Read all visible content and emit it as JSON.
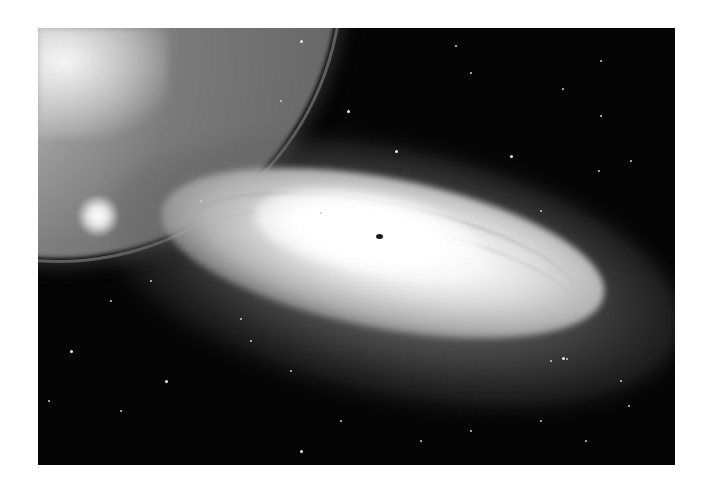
{
  "image": {
    "description": "Grayscale astronomical photograph of a spiral galaxy seen at an oblique angle, with a bright planetary limb in the upper-left corner and a scattered star field on a black background",
    "elements": [
      "planet-limb",
      "galaxy-disk",
      "galaxy-core",
      "bright-knot",
      "star-field"
    ],
    "colors": {
      "page_background": "#ffffff",
      "sky": "#050505",
      "core": "#ffffff",
      "disk": "#b3b3b3"
    }
  },
  "stars": [
    [
      347,
      110
    ],
    [
      320,
      212
    ],
    [
      280,
      100
    ],
    [
      455,
      45
    ],
    [
      470,
      72
    ],
    [
      395,
      150
    ],
    [
      600,
      60
    ],
    [
      562,
      88
    ],
    [
      630,
      160
    ],
    [
      600,
      115
    ],
    [
      510,
      155
    ],
    [
      540,
      210
    ],
    [
      598,
      170
    ],
    [
      620,
      380
    ],
    [
      550,
      360
    ],
    [
      562,
      357
    ],
    [
      566,
      358
    ],
    [
      585,
      440
    ],
    [
      48,
      400
    ],
    [
      120,
      410
    ],
    [
      165,
      380
    ],
    [
      200,
      200
    ],
    [
      240,
      318
    ],
    [
      290,
      370
    ],
    [
      340,
      420
    ],
    [
      300,
      450
    ],
    [
      420,
      440
    ],
    [
      470,
      430
    ],
    [
      540,
      420
    ],
    [
      628,
      405
    ],
    [
      70,
      350
    ],
    [
      110,
      300
    ],
    [
      150,
      280
    ],
    [
      250,
      340
    ],
    [
      385,
      20
    ],
    [
      300,
      40
    ]
  ]
}
